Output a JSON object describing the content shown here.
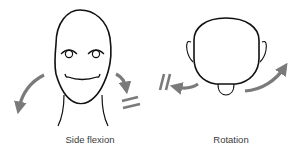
{
  "diagram": {
    "panels": [
      {
        "id": "side-flexion",
        "caption": "Side flexion",
        "figure": "front-view-face",
        "arrows": [
          {
            "name": "left-curved-arrow",
            "direction": "down-left"
          },
          {
            "name": "right-curved-arrow",
            "direction": "down-right"
          }
        ],
        "marker": "equals-sign"
      },
      {
        "id": "rotation",
        "caption": "Rotation",
        "figure": "top-view-head",
        "arrows": [
          {
            "name": "left-arrow",
            "direction": "left"
          },
          {
            "name": "right-curved-arrow",
            "direction": "up-right"
          }
        ],
        "marker": "parallel-bars"
      }
    ],
    "colors": {
      "line": "#111111",
      "arrow": "#7a7a7a",
      "text": "#3a3a3a",
      "background": "#ffffff"
    }
  }
}
